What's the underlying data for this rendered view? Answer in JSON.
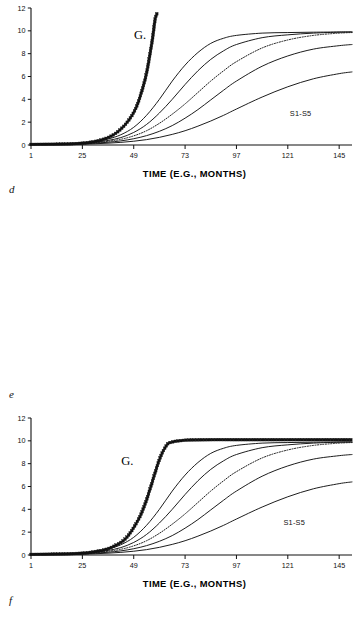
{
  "figure": {
    "panels": [
      {
        "letter": "d",
        "name": "panel-d",
        "xlabel": "TIME (E.G., MONTHS)",
        "ylabel": "",
        "g_label": "G.",
        "series_label": "S1-S5",
        "xticks": [
          "1",
          "25",
          "49",
          "73",
          "97",
          "121",
          "145"
        ],
        "yticks": [
          "0",
          "2",
          "4",
          "6",
          "8",
          "10",
          "12"
        ]
      },
      {
        "letter": "e",
        "name": "panel-e",
        "xlabel": "TIME (E.G., MONTHS)",
        "ylabel": "",
        "g_label": "G.",
        "series_label": "S1-S5",
        "xticks": [
          "1",
          "25",
          "49",
          "73",
          "97",
          "121",
          "145"
        ],
        "yticks": [
          "0",
          "2",
          "4",
          "6",
          "8",
          "10",
          "12"
        ]
      },
      {
        "letter": "f",
        "name": "panel-f",
        "xlabel": "TIME (E.G., MONTHS)",
        "ylabel": "",
        "g_label": "G.",
        "series_label": "S1-S5",
        "xticks": [
          "1",
          "25",
          "49",
          "73",
          "97",
          "121",
          "145"
        ],
        "yticks": [
          "0",
          "2",
          "4",
          "6",
          "8",
          "10",
          "12"
        ]
      }
    ]
  },
  "chart_data": [
    {
      "type": "line",
      "panel": "d",
      "title": "",
      "xlabel": "TIME (E.G., MONTHS)",
      "ylabel": "",
      "xlim": [
        1,
        151
      ],
      "ylim": [
        0,
        12
      ],
      "xticks": [
        1,
        25,
        49,
        73,
        97,
        121,
        145
      ],
      "yticks": [
        0,
        2,
        4,
        6,
        8,
        10,
        12
      ],
      "grid": false,
      "legend": "inline-annotations",
      "annotations": [
        {
          "text": "G.",
          "x": 52,
          "y": 9.3
        },
        {
          "text": "S1-S5",
          "x": 127,
          "y": 2.5
        }
      ],
      "series": [
        {
          "name": "G",
          "style": "markers",
          "marker": "square-star",
          "comment": "exponential / unbounded growth, exits top of plot",
          "x": [
            1,
            7,
            13,
            19,
            25,
            29,
            33,
            37,
            40,
            43,
            46,
            49,
            51,
            53,
            55,
            57,
            58,
            59,
            60
          ],
          "y": [
            0.05,
            0.06,
            0.07,
            0.1,
            0.16,
            0.25,
            0.4,
            0.65,
            0.95,
            1.4,
            2.0,
            2.85,
            3.7,
            4.85,
            6.3,
            8.4,
            9.6,
            11.0,
            11.6
          ]
        },
        {
          "name": "S1",
          "style": "solid",
          "asymptote": 9.9,
          "x": [
            1,
            13,
            25,
            31,
            37,
            43,
            49,
            55,
            61,
            67,
            73,
            79,
            85,
            91,
            97,
            109,
            121,
            133,
            145,
            151
          ],
          "y": [
            0.05,
            0.09,
            0.18,
            0.3,
            0.52,
            0.9,
            1.55,
            2.6,
            4.0,
            5.6,
            7.0,
            8.1,
            8.9,
            9.35,
            9.6,
            9.8,
            9.85,
            9.88,
            9.9,
            9.9
          ]
        },
        {
          "name": "S2",
          "style": "solid",
          "asymptote": 9.9,
          "x": [
            1,
            13,
            25,
            31,
            37,
            43,
            49,
            55,
            61,
            67,
            73,
            79,
            85,
            91,
            97,
            109,
            121,
            133,
            145,
            151
          ],
          "y": [
            0.05,
            0.08,
            0.15,
            0.24,
            0.4,
            0.65,
            1.1,
            1.8,
            2.8,
            4.0,
            5.3,
            6.5,
            7.5,
            8.25,
            8.8,
            9.4,
            9.65,
            9.8,
            9.88,
            9.9
          ]
        },
        {
          "name": "S3",
          "style": "dotted",
          "asymptote": 9.85,
          "x": [
            1,
            13,
            25,
            31,
            37,
            43,
            49,
            55,
            61,
            67,
            73,
            79,
            85,
            91,
            97,
            109,
            121,
            133,
            145,
            151
          ],
          "y": [
            0.05,
            0.07,
            0.13,
            0.2,
            0.32,
            0.5,
            0.8,
            1.25,
            1.9,
            2.7,
            3.6,
            4.6,
            5.6,
            6.5,
            7.3,
            8.5,
            9.2,
            9.6,
            9.8,
            9.85
          ]
        },
        {
          "name": "S4",
          "style": "solid",
          "asymptote": 8.8,
          "x": [
            1,
            13,
            25,
            31,
            37,
            43,
            49,
            55,
            61,
            67,
            73,
            79,
            85,
            91,
            97,
            109,
            121,
            133,
            145,
            151
          ],
          "y": [
            0.04,
            0.06,
            0.11,
            0.16,
            0.24,
            0.36,
            0.55,
            0.82,
            1.2,
            1.7,
            2.35,
            3.1,
            3.95,
            4.8,
            5.6,
            6.9,
            7.8,
            8.4,
            8.7,
            8.8
          ]
        },
        {
          "name": "S5",
          "style": "solid",
          "asymptote": 6.4,
          "x": [
            1,
            13,
            25,
            31,
            37,
            43,
            49,
            55,
            61,
            67,
            73,
            79,
            85,
            91,
            97,
            109,
            121,
            133,
            145,
            151
          ],
          "y": [
            0.03,
            0.05,
            0.08,
            0.11,
            0.16,
            0.23,
            0.33,
            0.47,
            0.67,
            0.93,
            1.25,
            1.65,
            2.1,
            2.6,
            3.15,
            4.2,
            5.1,
            5.8,
            6.25,
            6.4
          ]
        }
      ]
    },
    {
      "type": "line",
      "panel": "e",
      "title": "",
      "xlabel": "TIME (E.G., MONTHS)",
      "ylabel": "",
      "xlim": [
        1,
        151
      ],
      "ylim": [
        0,
        12
      ],
      "xticks": [
        1,
        25,
        49,
        73,
        97,
        121,
        145
      ],
      "yticks": [
        0,
        2,
        4,
        6,
        8,
        10,
        12
      ],
      "grid": false,
      "legend": "inline-annotations",
      "annotations": [
        {
          "text": "G.",
          "x": 46,
          "y": 7.9
        },
        {
          "text": "S1-S5",
          "x": 124,
          "y": 2.6
        }
      ],
      "series": [
        {
          "name": "G",
          "style": "markers",
          "marker": "square-star",
          "comment": "very steep logistic, saturates early at 10",
          "x": [
            1,
            13,
            25,
            31,
            37,
            43,
            46,
            49,
            52,
            54,
            56,
            58,
            60,
            62,
            64,
            66,
            73,
            85,
            97,
            109,
            121,
            133,
            145,
            151
          ],
          "y": [
            0.05,
            0.08,
            0.16,
            0.3,
            0.55,
            1.1,
            1.6,
            2.4,
            3.4,
            4.3,
            5.4,
            6.6,
            7.8,
            8.8,
            9.5,
            9.85,
            10.05,
            10.1,
            10.1,
            10.1,
            10.1,
            10.1,
            10.1,
            10.1
          ]
        },
        {
          "name": "S1",
          "style": "solid",
          "asymptote": 9.9,
          "x": [
            1,
            13,
            25,
            31,
            37,
            43,
            49,
            55,
            61,
            67,
            73,
            79,
            85,
            91,
            97,
            109,
            121,
            133,
            145,
            151
          ],
          "y": [
            0.05,
            0.09,
            0.18,
            0.3,
            0.52,
            0.9,
            1.55,
            2.6,
            4.0,
            5.6,
            7.0,
            8.1,
            8.9,
            9.35,
            9.6,
            9.8,
            9.85,
            9.88,
            9.9,
            9.9
          ]
        },
        {
          "name": "S2",
          "style": "solid",
          "asymptote": 9.9,
          "x": [
            1,
            13,
            25,
            31,
            37,
            43,
            49,
            55,
            61,
            67,
            73,
            79,
            85,
            91,
            97,
            109,
            121,
            133,
            145,
            151
          ],
          "y": [
            0.05,
            0.08,
            0.15,
            0.24,
            0.4,
            0.65,
            1.1,
            1.8,
            2.8,
            4.0,
            5.3,
            6.5,
            7.5,
            8.25,
            8.8,
            9.4,
            9.65,
            9.8,
            9.88,
            9.9
          ]
        },
        {
          "name": "S3",
          "style": "dotted",
          "asymptote": 9.85,
          "x": [
            1,
            13,
            25,
            31,
            37,
            43,
            49,
            55,
            61,
            67,
            73,
            79,
            85,
            91,
            97,
            109,
            121,
            133,
            145,
            151
          ],
          "y": [
            0.05,
            0.07,
            0.13,
            0.2,
            0.32,
            0.5,
            0.8,
            1.25,
            1.9,
            2.7,
            3.6,
            4.6,
            5.6,
            6.5,
            7.3,
            8.5,
            9.2,
            9.6,
            9.8,
            9.85
          ]
        },
        {
          "name": "S4",
          "style": "solid",
          "asymptote": 8.8,
          "x": [
            1,
            13,
            25,
            31,
            37,
            43,
            49,
            55,
            61,
            67,
            73,
            79,
            85,
            91,
            97,
            109,
            121,
            133,
            145,
            151
          ],
          "y": [
            0.04,
            0.06,
            0.11,
            0.16,
            0.24,
            0.36,
            0.55,
            0.82,
            1.2,
            1.7,
            2.35,
            3.1,
            3.95,
            4.8,
            5.6,
            6.9,
            7.8,
            8.4,
            8.7,
            8.8
          ]
        },
        {
          "name": "S5",
          "style": "solid",
          "asymptote": 6.4,
          "x": [
            1,
            13,
            25,
            31,
            37,
            43,
            49,
            55,
            61,
            67,
            73,
            79,
            85,
            91,
            97,
            109,
            121,
            133,
            145,
            151
          ],
          "y": [
            0.03,
            0.05,
            0.08,
            0.11,
            0.16,
            0.23,
            0.33,
            0.47,
            0.67,
            0.93,
            1.25,
            1.65,
            2.1,
            2.6,
            3.15,
            4.2,
            5.1,
            5.8,
            6.25,
            6.4
          ]
        }
      ]
    },
    {
      "type": "line",
      "panel": "f",
      "title": "",
      "xlabel": "TIME (E.G., MONTHS)",
      "ylabel": "",
      "xlim": [
        1,
        151
      ],
      "ylim": [
        0,
        12
      ],
      "xticks": [
        1,
        25,
        49,
        73,
        97,
        121,
        145
      ],
      "yticks": [
        0,
        2,
        4,
        6,
        8,
        10,
        12
      ],
      "grid": false,
      "legend": "inline-annotations",
      "annotations": [
        {
          "text": "G.",
          "x": 62,
          "y": 7.0
        },
        {
          "text": "S1-S5",
          "x": 130,
          "y": 2.6
        }
      ],
      "series": [
        {
          "name": "G",
          "style": "markers",
          "marker": "square-star",
          "comment": "moderate logistic, plateaus near 10.3",
          "x": [
            1,
            13,
            25,
            31,
            37,
            43,
            49,
            55,
            61,
            67,
            73,
            79,
            85,
            91,
            97,
            109,
            121,
            133,
            145,
            151
          ],
          "y": [
            0.07,
            0.12,
            0.25,
            0.42,
            0.7,
            1.15,
            1.85,
            2.9,
            4.4,
            6.1,
            7.6,
            8.6,
            9.3,
            9.7,
            9.95,
            10.15,
            10.25,
            10.3,
            10.3,
            10.3
          ]
        },
        {
          "name": "S1",
          "style": "solid",
          "asymptote": 10.1,
          "x": [
            1,
            13,
            25,
            31,
            37,
            43,
            49,
            55,
            61,
            67,
            73,
            79,
            85,
            91,
            97,
            109,
            121,
            133,
            145,
            151
          ],
          "y": [
            0.05,
            0.09,
            0.18,
            0.28,
            0.45,
            0.75,
            1.25,
            2.0,
            3.1,
            4.5,
            5.9,
            7.1,
            8.1,
            8.8,
            9.3,
            9.8,
            10.0,
            10.05,
            10.1,
            10.1
          ]
        },
        {
          "name": "S2",
          "style": "solid",
          "asymptote": 9.85,
          "x": [
            1,
            13,
            25,
            31,
            37,
            43,
            49,
            55,
            61,
            67,
            73,
            79,
            85,
            91,
            97,
            109,
            121,
            133,
            145,
            151
          ],
          "y": [
            0.05,
            0.08,
            0.15,
            0.23,
            0.37,
            0.58,
            0.95,
            1.5,
            2.3,
            3.4,
            4.6,
            5.8,
            6.9,
            7.8,
            8.5,
            9.3,
            9.6,
            9.75,
            9.82,
            9.85
          ]
        },
        {
          "name": "S3",
          "style": "dotted",
          "asymptote": 9.6,
          "x": [
            1,
            13,
            25,
            31,
            37,
            43,
            49,
            55,
            61,
            67,
            73,
            79,
            85,
            91,
            97,
            109,
            121,
            133,
            145,
            151
          ],
          "y": [
            0.04,
            0.07,
            0.12,
            0.18,
            0.28,
            0.44,
            0.7,
            1.1,
            1.7,
            2.5,
            3.4,
            4.4,
            5.4,
            6.3,
            7.1,
            8.3,
            9.0,
            9.4,
            9.55,
            9.6
          ]
        },
        {
          "name": "S4",
          "style": "solid",
          "asymptote": 8.6,
          "x": [
            1,
            13,
            25,
            31,
            37,
            43,
            49,
            55,
            61,
            67,
            73,
            79,
            85,
            91,
            97,
            109,
            121,
            133,
            145,
            151
          ],
          "y": [
            0.04,
            0.06,
            0.1,
            0.15,
            0.22,
            0.33,
            0.5,
            0.76,
            1.12,
            1.6,
            2.2,
            2.9,
            3.7,
            4.55,
            5.4,
            6.7,
            7.6,
            8.2,
            8.5,
            8.6
          ]
        },
        {
          "name": "S5",
          "style": "solid",
          "asymptote": 6.0,
          "x": [
            1,
            13,
            25,
            31,
            37,
            43,
            49,
            55,
            61,
            67,
            73,
            79,
            85,
            91,
            97,
            109,
            121,
            133,
            145,
            151
          ],
          "y": [
            0.03,
            0.04,
            0.07,
            0.1,
            0.14,
            0.2,
            0.29,
            0.42,
            0.6,
            0.84,
            1.15,
            1.52,
            1.95,
            2.45,
            3.0,
            4.0,
            4.9,
            5.5,
            5.88,
            6.0
          ]
        }
      ]
    }
  ]
}
